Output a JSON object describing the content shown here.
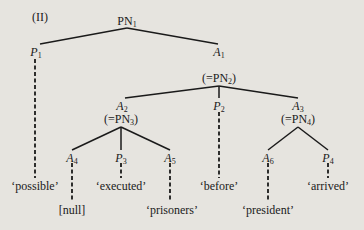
{
  "diagram": {
    "title": "(II)",
    "nodes": {
      "root": {
        "label": "PN",
        "sub": "1"
      },
      "p1": {
        "label": "P",
        "sub": "1"
      },
      "a1": {
        "label": "A",
        "sub": "1"
      },
      "pn2": {
        "label": "(=PN",
        "sub": "2",
        "close": ")"
      },
      "a2": {
        "label": "A",
        "sub": "2"
      },
      "pn3": {
        "label": "(=PN",
        "sub": "3",
        "close": ")"
      },
      "p2": {
        "label": "P",
        "sub": "2"
      },
      "a3": {
        "label": "A",
        "sub": "3"
      },
      "pn4": {
        "label": "(=PN",
        "sub": "4",
        "close": ")"
      },
      "a4": {
        "label": "A",
        "sub": "4"
      },
      "p3": {
        "label": "P",
        "sub": "3"
      },
      "a5": {
        "label": "A",
        "sub": "5"
      },
      "a6": {
        "label": "A",
        "sub": "6"
      },
      "p4": {
        "label": "P",
        "sub": "4"
      }
    },
    "leaves": {
      "possible": "‘possible’",
      "executed": "‘executed’",
      "before": "‘before’",
      "arrived": "‘arrived’",
      "null": "[null]",
      "prisoners": "‘prisoners’",
      "president": "‘president’"
    }
  }
}
